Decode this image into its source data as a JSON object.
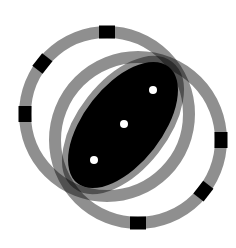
{
  "figure": {
    "title": "Two overlapping segmented rings with lens",
    "colors": {
      "background": "#ffffff",
      "ring": "#8f8f8f",
      "ring_overlap": "#6a6a6a",
      "marker": "#000000",
      "lens_fill": "#000000",
      "dot": "#ffffff"
    },
    "rings": [
      {
        "name": "ring-upper-left",
        "cx": 107,
        "cy": 114,
        "r": 82,
        "width": 12,
        "marker_angles": [
          -90,
          -142,
          180
        ]
      },
      {
        "name": "ring-lower-right",
        "cx": 138,
        "cy": 140,
        "r": 83,
        "width": 12,
        "marker_angles": [
          0,
          38,
          90
        ]
      }
    ],
    "lens": {
      "cx": 123,
      "cy": 125,
      "rx": 80,
      "ry": 45,
      "rotation": -52,
      "stroke_width": 12
    },
    "dots": [
      {
        "x": 153,
        "y": 90,
        "r": 4
      },
      {
        "x": 124,
        "y": 124,
        "r": 4
      },
      {
        "x": 94,
        "y": 160,
        "r": 4
      }
    ]
  }
}
